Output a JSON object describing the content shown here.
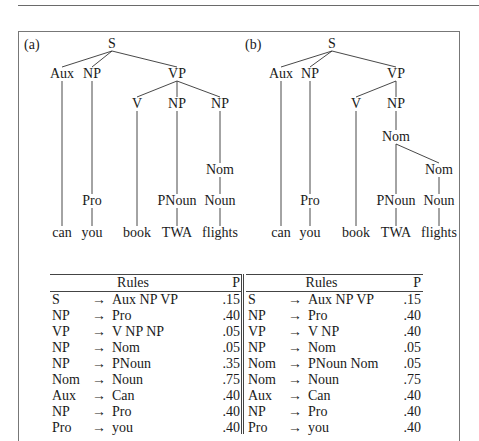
{
  "figure": {
    "trees": [
      {
        "label": "(a)",
        "nodes": {
          "S": "S",
          "Aux": "Aux",
          "NP1": "NP",
          "VP": "VP",
          "V": "V",
          "NP2": "NP",
          "NP3": "NP",
          "Nom": "Nom",
          "Pro": "Pro",
          "PNoun": "PNoun",
          "Noun": "Noun",
          "w1": "can",
          "w2": "you",
          "w3": "book",
          "w4": "TWA",
          "w5": "flights"
        }
      },
      {
        "label": "(b)",
        "nodes": {
          "S": "S",
          "Aux": "Aux",
          "NP1": "NP",
          "VP": "VP",
          "V": "V",
          "NP2": "NP",
          "Nom1": "Nom",
          "Nom2": "Nom",
          "Pro": "Pro",
          "PNoun": "PNoun",
          "Noun": "Noun",
          "w1": "can",
          "w2": "you",
          "w3": "book",
          "w4": "TWA",
          "w5": "flights"
        }
      }
    ],
    "tables": [
      {
        "header": {
          "rules": "Rules",
          "p": "P"
        },
        "rows": [
          {
            "lhs": "S",
            "arrow": "→",
            "rhs": "Aux NP VP",
            "p": ".15"
          },
          {
            "lhs": "NP",
            "arrow": "→",
            "rhs": "Pro",
            "p": ".40"
          },
          {
            "lhs": "VP",
            "arrow": "→",
            "rhs": "V NP NP",
            "p": ".05"
          },
          {
            "lhs": "NP",
            "arrow": "→",
            "rhs": "Nom",
            "p": ".05"
          },
          {
            "lhs": "NP",
            "arrow": "→",
            "rhs": "PNoun",
            "p": ".35"
          },
          {
            "lhs": "Nom",
            "arrow": "→",
            "rhs": "Noun",
            "p": ".75"
          },
          {
            "lhs": "Aux",
            "arrow": "→",
            "rhs": "Can",
            "p": ".40"
          },
          {
            "lhs": "NP",
            "arrow": "→",
            "rhs": "Pro",
            "p": ".40"
          },
          {
            "lhs": "Pro",
            "arrow": "→",
            "rhs": "you",
            "p": ".40"
          }
        ]
      },
      {
        "header": {
          "rules": "Rules",
          "p": "P"
        },
        "rows": [
          {
            "lhs": "S",
            "arrow": "→",
            "rhs": "Aux NP VP",
            "p": ".15"
          },
          {
            "lhs": "NP",
            "arrow": "→",
            "rhs": "Pro",
            "p": ".40"
          },
          {
            "lhs": "VP",
            "arrow": "→",
            "rhs": "V NP",
            "p": ".40"
          },
          {
            "lhs": "NP",
            "arrow": "→",
            "rhs": "Nom",
            "p": ".05"
          },
          {
            "lhs": "Nom",
            "arrow": "→",
            "rhs": "PNoun Nom",
            "p": ".05"
          },
          {
            "lhs": "Nom",
            "arrow": "→",
            "rhs": "Noun",
            "p": ".75"
          },
          {
            "lhs": "Aux",
            "arrow": "→",
            "rhs": "Can",
            "p": ".40"
          },
          {
            "lhs": "NP",
            "arrow": "→",
            "rhs": "Pro",
            "p": ".40"
          },
          {
            "lhs": "Pro",
            "arrow": "→",
            "rhs": "you",
            "p": ".40"
          }
        ]
      }
    ]
  }
}
